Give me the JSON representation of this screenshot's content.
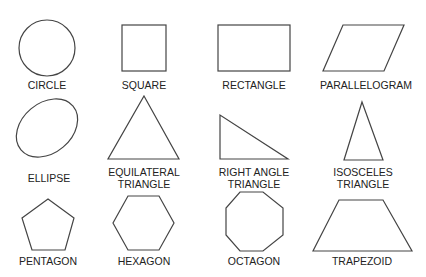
{
  "shapes": [
    {
      "name": "circle",
      "label": "CIRCLE"
    },
    {
      "name": "square",
      "label": "SQUARE"
    },
    {
      "name": "rectangle",
      "label": "RECTANGLE"
    },
    {
      "name": "parallelogram",
      "label": "PARALLELOGRAM"
    },
    {
      "name": "ellipse",
      "label": "ELLIPSE"
    },
    {
      "name": "equilateral-triangle",
      "label": "EQUILATERAL\nTRIANGLE"
    },
    {
      "name": "right-angle-triangle",
      "label": "RIGHT ANGLE\nTRIANGLE"
    },
    {
      "name": "isosceles-triangle",
      "label": "ISOSCELES\nTRIANGLE"
    },
    {
      "name": "pentagon",
      "label": "PENTAGON"
    },
    {
      "name": "hexagon",
      "label": "HEXAGON"
    },
    {
      "name": "octagon",
      "label": "OCTAGON"
    },
    {
      "name": "trapezoid",
      "label": "TRAPEZOID"
    }
  ],
  "colors": {
    "stroke": "#444444",
    "text": "#222222",
    "background": "#ffffff"
  }
}
